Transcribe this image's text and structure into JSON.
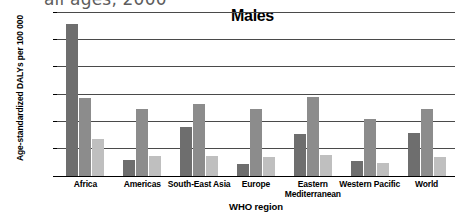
{
  "caption_remnant": "all ages, 2000",
  "chart_data": {
    "type": "bar",
    "title": "Males",
    "xlabel": "WHO region",
    "ylabel": "Age-standardized DALYs per 100 000",
    "grid": true,
    "legend_position": "none",
    "ylim": [
      0,
      30000
    ],
    "ytick_labels": [
      "0",
      "5000",
      "10 000",
      "15 000",
      "20 000",
      "25 000",
      "30 000"
    ],
    "ytick_values": [
      0,
      5000,
      10000,
      15000,
      20000,
      25000,
      30000
    ],
    "categories": [
      "Africa",
      "Americas",
      "South-East Asia",
      "Europe",
      "Eastern Mediterranean",
      "Western Pacific",
      "World"
    ],
    "series": [
      {
        "name": "series-1",
        "color": "#6e6e6e",
        "values": [
          27800,
          2900,
          9000,
          2200,
          7700,
          2700,
          7900
        ]
      },
      {
        "name": "series-2",
        "color": "#8c8c8c",
        "values": [
          14300,
          12200,
          13200,
          12300,
          14400,
          10500,
          12200
        ]
      },
      {
        "name": "series-3",
        "color": "#bfbfbf",
        "values": [
          6700,
          3700,
          3600,
          3400,
          3900,
          2400,
          3500
        ]
      }
    ]
  }
}
